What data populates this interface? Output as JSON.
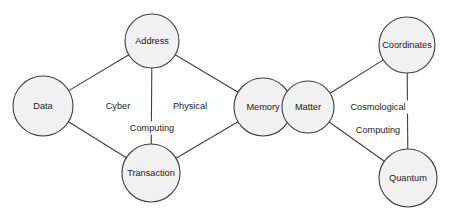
{
  "diagram": {
    "background_color": "#ffffff",
    "node_fill_color": "#f1f1f1",
    "stroke_color": "#3f3f3f",
    "text_color": "#1a1a1a",
    "nodes": [
      {
        "id": "data",
        "label": "Data",
        "cx": 43,
        "cy": 106,
        "r": 30
      },
      {
        "id": "address",
        "label": "Address",
        "cx": 152,
        "cy": 41,
        "r": 27
      },
      {
        "id": "transaction",
        "label": "Transaction",
        "cx": 151,
        "cy": 173,
        "r": 29
      },
      {
        "id": "memory",
        "label": "Memory",
        "cx": 263,
        "cy": 107,
        "r": 29
      },
      {
        "id": "matter",
        "label": "Matter",
        "cx": 308,
        "cy": 107,
        "r": 26
      },
      {
        "id": "coordinates",
        "label": "Coordinates",
        "cx": 407,
        "cy": 45,
        "r": 28
      },
      {
        "id": "quantum",
        "label": "Quantum",
        "cx": 408,
        "cy": 178,
        "r": 29
      }
    ],
    "edges": [
      {
        "id": "edge-data-address",
        "from": "data",
        "to": "address"
      },
      {
        "id": "edge-data-transaction",
        "from": "data",
        "to": "transaction"
      },
      {
        "id": "edge-address-transaction",
        "from": "address",
        "to": "transaction"
      },
      {
        "id": "edge-address-memory",
        "from": "address",
        "to": "memory"
      },
      {
        "id": "edge-transaction-memory",
        "from": "transaction",
        "to": "memory"
      },
      {
        "id": "edge-matter-coordinates",
        "from": "matter",
        "to": "coordinates"
      },
      {
        "id": "edge-matter-quantum",
        "from": "matter",
        "to": "quantum"
      },
      {
        "id": "edge-coordinates-quantum",
        "from": "coordinates",
        "to": "quantum"
      }
    ],
    "edge_labels": [
      {
        "id": "label-cyber",
        "text": "Cyber",
        "x": 118,
        "y": 106
      },
      {
        "id": "label-physical",
        "text": "Physical",
        "x": 190,
        "y": 106
      },
      {
        "id": "label-computing-left",
        "text": "Computing",
        "x": 152,
        "y": 128
      },
      {
        "id": "label-cosmological",
        "text": "Cosmological",
        "x": 378,
        "y": 107
      },
      {
        "id": "label-computing-right",
        "text": "Computing",
        "x": 378,
        "y": 130
      }
    ]
  }
}
